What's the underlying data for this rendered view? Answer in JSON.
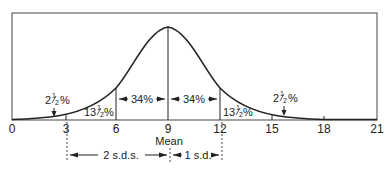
{
  "diagram": {
    "type": "normal-distribution",
    "x_ticks": [
      "0",
      "3",
      "6",
      "9",
      "12",
      "15",
      "18",
      "21"
    ],
    "mean_label": "Mean",
    "regions": {
      "left_tail": {
        "whole": "2",
        "num": "1",
        "den": "2",
        "pct": "%"
      },
      "left_mid": {
        "whole": "13",
        "num": "1",
        "den": "2",
        "pct": "%"
      },
      "left_center": "34%",
      "right_center": "34%",
      "right_mid": {
        "whole": "13",
        "num": "1",
        "den": "2",
        "pct": "%"
      },
      "right_tail": {
        "whole": "2",
        "num": "1",
        "den": "2",
        "pct": "%"
      }
    },
    "spans": {
      "two_sd": "2 s.d.s.",
      "one_sd": "1 s.d."
    },
    "colors": {
      "line": "#222222",
      "background": "#ffffff"
    }
  }
}
